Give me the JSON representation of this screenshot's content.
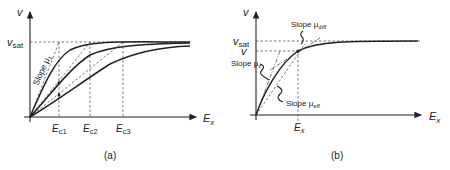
{
  "figure": {
    "panel_a": {
      "caption": "(a)",
      "y_axis_label": "v",
      "x_axis_label": "E",
      "x_axis_sub": "x",
      "vsat_label": "v",
      "vsat_sub": "sat",
      "slope_label": "Slope μ",
      "slope_sub": "1",
      "ticks": [
        {
          "label": "E",
          "sub": "c1"
        },
        {
          "label": "E",
          "sub": "c2"
        },
        {
          "label": "E",
          "sub": "c3"
        }
      ]
    },
    "panel_b": {
      "caption": "(b)",
      "y_axis_label": "v",
      "x_axis_label": "E",
      "x_axis_sub": "x",
      "vsat_label": "v",
      "vsat_sub": "sat",
      "v_label": "v",
      "tick": {
        "label": "E",
        "sub": "x"
      },
      "slope_diff": {
        "text": "Slope μ",
        "sub": "diff"
      },
      "slope_z": {
        "text": "Slope μ",
        "sub": "z"
      },
      "slope_eff": {
        "text": "Slope μ",
        "sub": "eff"
      }
    }
  }
}
